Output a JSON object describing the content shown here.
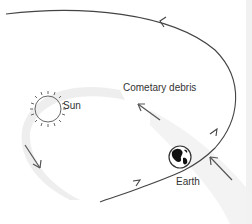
{
  "diagram": {
    "labels": {
      "debris": "Cometary debris",
      "sun": "Sun",
      "earth": "Earth"
    },
    "icons": {
      "sun": "sun-icon",
      "earth": "earth-globe-icon"
    },
    "colors": {
      "orbit": "#444444",
      "arrow": "#555555",
      "debris_stream": "#e8e8e8",
      "text": "#333333"
    }
  }
}
